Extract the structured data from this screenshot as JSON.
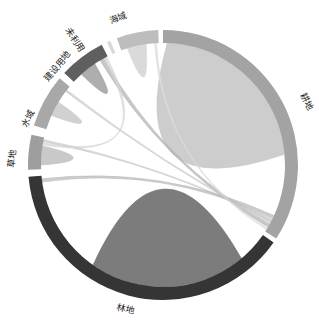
{
  "chart_data": {
    "type": "chord",
    "title": "",
    "center": [
      163,
      165
    ],
    "outer_radius": 135,
    "inner_radius": 122,
    "groups": [
      {
        "name": "耕地",
        "start": 0,
        "end": 123,
        "color": "#a3a3a3"
      },
      {
        "name": "林地",
        "start": 125,
        "end": 265,
        "color": "#353535"
      },
      {
        "name": "草地",
        "start": 268,
        "end": 283,
        "color": "#9e9e9e"
      },
      {
        "name": "水域",
        "start": 287,
        "end": 310,
        "color": "#a8a8a8"
      },
      {
        "name": "建设用地",
        "start": 313,
        "end": 333,
        "color": "#5f5f5f"
      },
      {
        "name": "未利用",
        "start": 335.5,
        "end": 337,
        "color": "#d9d9d9"
      },
      {
        "name": "海域",
        "start": 340,
        "end": 358,
        "color": "#bdbdbd"
      }
    ],
    "chords": [
      {
        "source": "耕地",
        "target": "耕地",
        "s": [
          2,
          85
        ],
        "t": [
          2,
          85
        ],
        "color": "#c4c4c4",
        "opacity": 0.85
      },
      {
        "source": "林地",
        "target": "林地",
        "s": [
          140,
          215
        ],
        "t": [
          140,
          215
        ],
        "color": "#6e6e6e",
        "opacity": 0.9
      },
      {
        "source": "海域",
        "target": "海域",
        "s": [
          343,
          352
        ],
        "t": [
          343,
          352
        ],
        "color": "#d6d6d6",
        "opacity": 0.9
      },
      {
        "source": "建设用地",
        "target": "建设用地",
        "s": [
          318,
          326
        ],
        "t": [
          318,
          326
        ],
        "color": "#9a9a9a",
        "opacity": 0.8
      },
      {
        "source": "水域",
        "target": "水域",
        "s": [
          294,
          301
        ],
        "t": [
          294,
          301
        ],
        "color": "#c6c6c6",
        "opacity": 0.8
      },
      {
        "source": "草地",
        "target": "草地",
        "s": [
          270,
          279
        ],
        "t": [
          270,
          279
        ],
        "color": "#bcbcbc",
        "opacity": 0.8
      },
      {
        "source": "建设用地",
        "target": "耕地",
        "s": [
          329,
          331
        ],
        "t": [
          119,
          120.5
        ],
        "color": "#b0b0b0",
        "opacity": 0.7
      },
      {
        "source": "水域",
        "target": "耕地",
        "s": [
          307,
          308
        ],
        "t": [
          117.5,
          118.5
        ],
        "color": "#c8c8c8",
        "opacity": 0.7
      },
      {
        "source": "草地",
        "target": "耕地",
        "s": [
          281,
          282
        ],
        "t": [
          116.5,
          117.3
        ],
        "color": "#c8c8c8",
        "opacity": 0.7
      },
      {
        "source": "林地",
        "target": "耕地",
        "s": [
          262,
          263.5
        ],
        "t": [
          114.5,
          116
        ],
        "color": "#b8b8b8",
        "opacity": 0.7
      },
      {
        "source": "建设用地",
        "target": "草地",
        "s": [
          331,
          332.5
        ],
        "t": [
          279.5,
          280.5
        ],
        "color": "#d4d4d4",
        "opacity": 0.7
      },
      {
        "source": "海域",
        "target": "耕地",
        "s": [
          356,
          357
        ],
        "t": [
          121,
          122
        ],
        "color": "#dcdcdc",
        "opacity": 0.7
      }
    ],
    "legend": "none",
    "grid": false
  },
  "labels": {
    "gengdi": "耕地",
    "lindi": "林地",
    "caodi": "草地",
    "shuiyu": "水域",
    "jianshe": "建设用地",
    "weiliyong": "未利用",
    "haiyu": "海域"
  }
}
